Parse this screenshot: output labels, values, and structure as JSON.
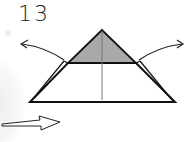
{
  "step": {
    "number": "13"
  },
  "diagram": {
    "colors": {
      "shaded": "#a9a9a9",
      "line": "#111111",
      "crease": "#777777",
      "paper": "#ffffff"
    },
    "elements": [
      {
        "type": "shaded-triangle",
        "label": "top layer triangle"
      },
      {
        "type": "trapezoid",
        "label": "model base"
      },
      {
        "type": "center-crease",
        "label": "vertical crease line"
      },
      {
        "type": "curved-arrow",
        "direction": "up-left",
        "label": "pull flap left"
      },
      {
        "type": "curved-arrow",
        "direction": "up-right",
        "label": "pull flap right"
      },
      {
        "type": "push-arrow",
        "direction": "right",
        "label": "push arrow"
      }
    ]
  }
}
